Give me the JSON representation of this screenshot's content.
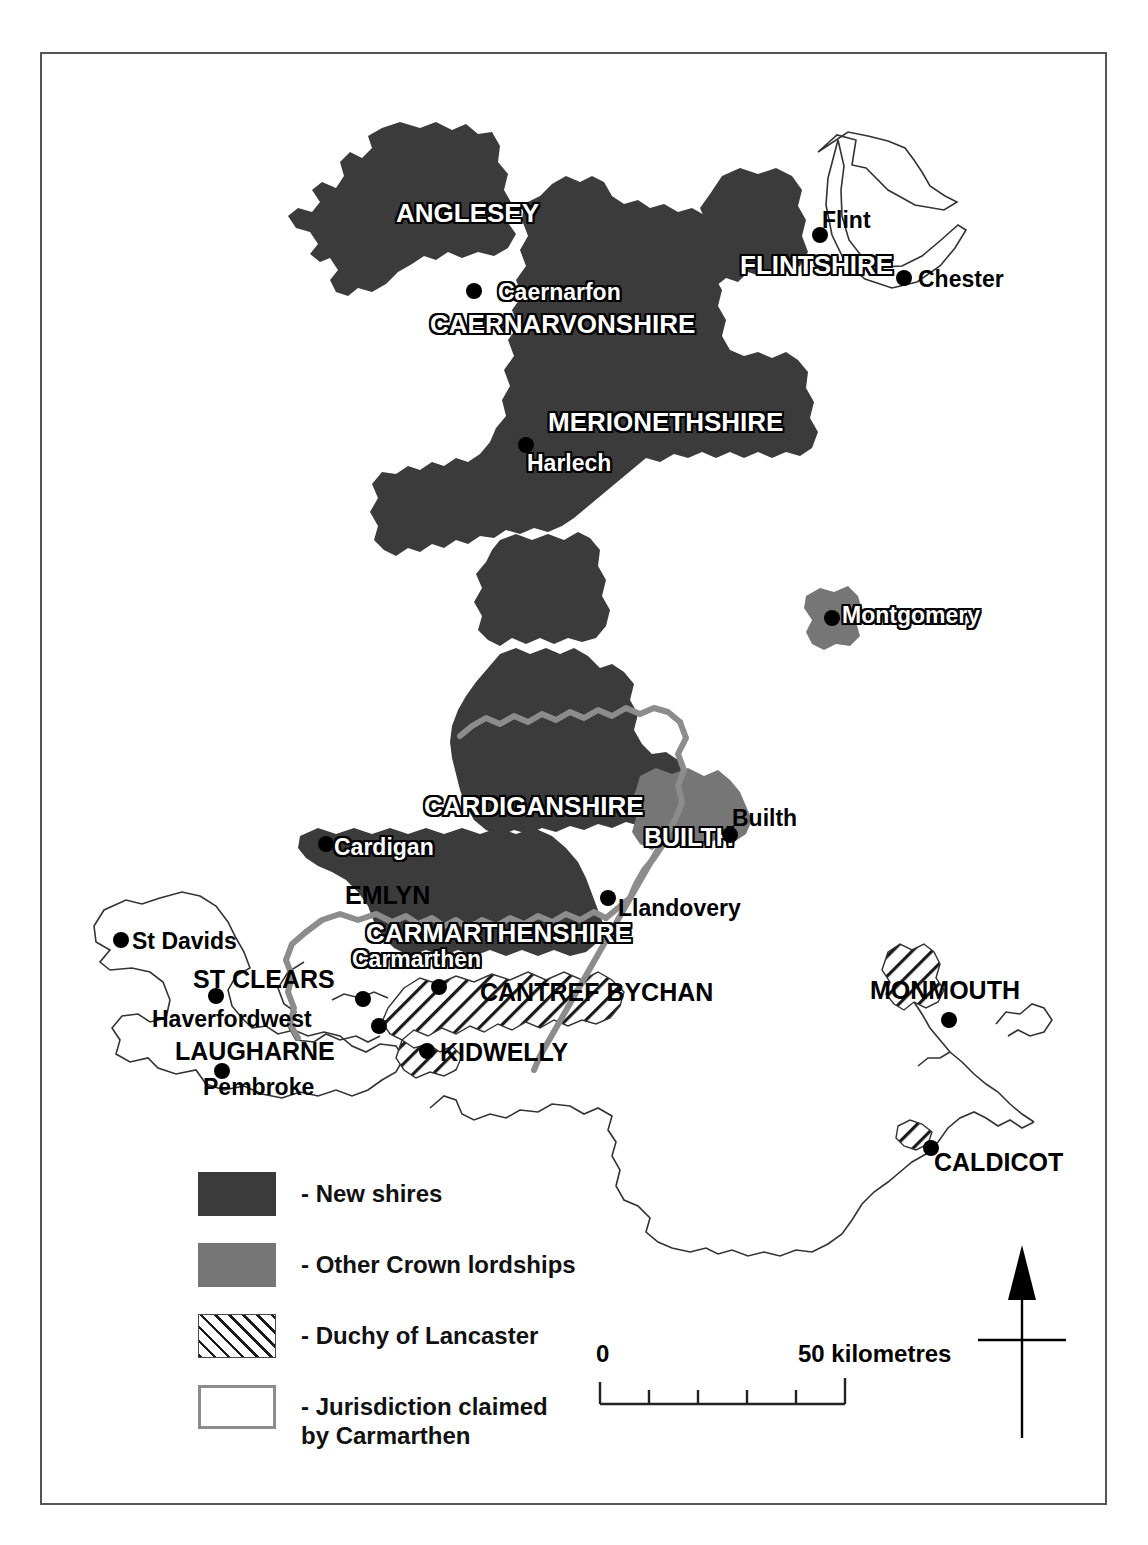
{
  "map": {
    "title": "Wales: new shires and Crown lordships",
    "frame_color": "#555555",
    "background": "#ffffff"
  },
  "colors": {
    "new_shires": "#3b3b3b",
    "other_crown_lordships": "#767676",
    "duchy_of_lancaster_hatch": "#1a1a1a",
    "jurisdiction_line": "#8c8c8c",
    "coastline": "#333333",
    "town_dot": "#000000"
  },
  "regions": [
    {
      "name": "ANGLESEY",
      "category": "new-shires",
      "label_style": "halo"
    },
    {
      "name": "CAERNARVONSHIRE",
      "category": "new-shires",
      "label_style": "halo"
    },
    {
      "name": "FLINTSHIRE",
      "category": "new-shires",
      "label_style": "halo"
    },
    {
      "name": "MERIONETHSHIRE",
      "category": "new-shires",
      "label_style": "halo"
    },
    {
      "name": "CARDIGANSHIRE",
      "category": "new-shires",
      "label_style": "halo"
    },
    {
      "name": "CARMARTHENSHIRE",
      "category": "new-shires",
      "label_style": "halo"
    },
    {
      "name": "BUILTH",
      "category": "other-crown-lordships",
      "label_style": "halo"
    },
    {
      "name": "EMLYN",
      "category": "jurisdiction-claimed",
      "label_style": "plain"
    },
    {
      "name": "ST CLEARS",
      "category": "jurisdiction-claimed",
      "label_style": "plain"
    },
    {
      "name": "LAUGHARNE",
      "category": "jurisdiction-claimed",
      "label_style": "plain"
    },
    {
      "name": "KIDWELLY",
      "category": "duchy-of-lancaster",
      "label_style": "plain"
    },
    {
      "name": "CANTREF BYCHAN",
      "category": "duchy-of-lancaster",
      "label_style": "plain"
    },
    {
      "name": "MONMOUTH",
      "category": "duchy-of-lancaster",
      "label_style": "plain"
    },
    {
      "name": "CALDICOT",
      "category": "duchy-of-lancaster",
      "label_style": "plain"
    }
  ],
  "towns": [
    {
      "name": "Caernarfon",
      "label_style": "halo"
    },
    {
      "name": "Flint",
      "label_style": "plain"
    },
    {
      "name": "Chester",
      "label_style": "plain"
    },
    {
      "name": "Harlech",
      "label_style": "halo"
    },
    {
      "name": "Montgomery",
      "label_style": "halo"
    },
    {
      "name": "Builth",
      "label_style": "plain"
    },
    {
      "name": "Cardigan",
      "label_style": "halo"
    },
    {
      "name": "Llandovery",
      "label_style": "plain"
    },
    {
      "name": "Carmarthen",
      "label_style": "halo"
    },
    {
      "name": "St Davids",
      "label_style": "plain"
    },
    {
      "name": "Haverfordwest",
      "label_style": "plain"
    },
    {
      "name": "Pembroke",
      "label_style": "plain"
    }
  ],
  "legend": {
    "items": [
      {
        "swatch": "dark",
        "label": "- New shires"
      },
      {
        "swatch": "mid",
        "label": "- Other Crown lordships"
      },
      {
        "swatch": "hatch",
        "label": "- Duchy of Lancaster"
      },
      {
        "swatch": "outline",
        "label_line1": "- Jurisdiction claimed",
        "label_line2": "by Carmarthen"
      }
    ]
  },
  "scale_bar": {
    "min_label": "0",
    "max_label": "50 kilometres",
    "divisions": 5,
    "units": "kilometres",
    "length_km": 50
  },
  "north_arrow": {
    "direction": "north",
    "label": ""
  }
}
